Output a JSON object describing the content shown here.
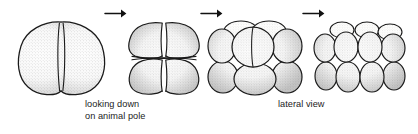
{
  "figure": {
    "background_color": "#ffffff",
    "ink_color": "#1a1a1a",
    "cell_fill_color": "#fdfdfc",
    "stipple_color": "#2a2a2a"
  },
  "stages": [
    {
      "id": "stage-2-cell",
      "name": "two-cell stage",
      "cell_count": 2,
      "view": "looking down on animal pole",
      "tiers": 1
    },
    {
      "id": "stage-4-cell",
      "name": "four-cell stage",
      "cell_count": 4,
      "view": "looking down on animal pole",
      "tiers": 2
    },
    {
      "id": "stage-8-cell",
      "name": "eight-cell stage",
      "cell_count": 8,
      "view": "lateral view",
      "tiers": 2
    },
    {
      "id": "stage-16-cell",
      "name": "sixteen-cell stage",
      "cell_count": 16,
      "view": "lateral view",
      "tiers": 2
    }
  ],
  "arrows": [
    {
      "id": "arrow-1",
      "icon": "right-arrow-icon",
      "glyph": "→",
      "from": "stage-2-cell",
      "to": "stage-4-cell"
    },
    {
      "id": "arrow-2",
      "icon": "right-arrow-icon",
      "glyph": "→",
      "from": "stage-4-cell",
      "to": "stage-8-cell"
    },
    {
      "id": "arrow-3",
      "icon": "right-arrow-icon",
      "glyph": "→",
      "from": "stage-8-cell",
      "to": "stage-16-cell"
    }
  ],
  "captions": {
    "animal_pole": {
      "line1": "looking down",
      "line2": "on animal pole"
    },
    "lateral": {
      "line1": "lateral view"
    }
  }
}
